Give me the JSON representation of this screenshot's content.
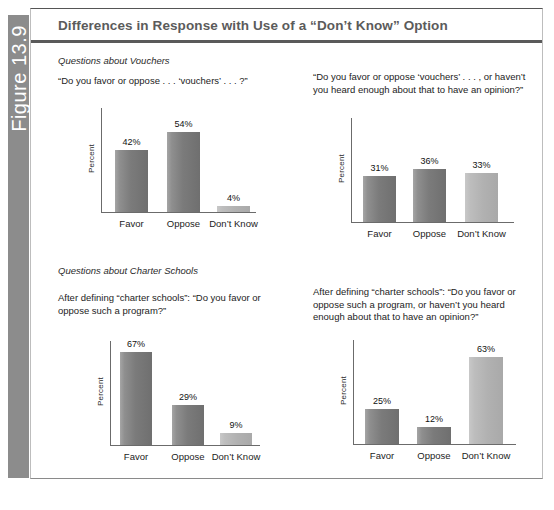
{
  "figure": {
    "number_label": "Figure 13.9",
    "title": "Differences in Response with Use of a “Don’t Know” Option"
  },
  "panels": [
    {
      "id": "vouchers-no-dk",
      "section_heading": "Questions about Vouchers",
      "question": "“Do you favor or oppose . . . ‘vouchers’ . . . ?”",
      "ylabel": "Percent"
    },
    {
      "id": "vouchers-with-dk",
      "section_heading": "",
      "question": "“Do you favor or oppose ‘vouchers’ . . . , or haven’t you heard enough about that to have an opinion?”",
      "ylabel": "Percent"
    },
    {
      "id": "charter-no-dk",
      "section_heading": "Questions about Charter Schools",
      "question": "After defining “charter schools”: “Do you favor or oppose such a program?”",
      "ylabel": "Percent"
    },
    {
      "id": "charter-with-dk",
      "section_heading": "",
      "question": "After defining “charter schools”: “Do you favor or oppose such a program, or haven’t you heard enough about that to have an opinion?”",
      "ylabel": "Percent"
    }
  ],
  "chart_data": [
    {
      "type": "bar",
      "id": "vouchers-no-dk",
      "title": "“Do you favor or oppose . . . ‘vouchers’ . . . ?”",
      "categories": [
        "Favor",
        "Oppose",
        "Don’t Know"
      ],
      "values": [
        42,
        54,
        4
      ],
      "value_labels": [
        "42%",
        "54%",
        "4%"
      ],
      "bar_styles": [
        "dark",
        "dark",
        "light"
      ],
      "xlabel": "",
      "ylabel": "Percent",
      "ylim": [
        0,
        70
      ],
      "grid": false,
      "legend": "none"
    },
    {
      "type": "bar",
      "id": "vouchers-with-dk",
      "title": "“Do you favor or oppose ‘vouchers’ . . . , or haven’t you heard enough about that to have an opinion?”",
      "categories": [
        "Favor",
        "Oppose",
        "Don’t Know"
      ],
      "values": [
        31,
        36,
        33
      ],
      "value_labels": [
        "31%",
        "36%",
        "33%"
      ],
      "bar_styles": [
        "dark",
        "dark",
        "light"
      ],
      "xlabel": "",
      "ylabel": "Percent",
      "ylim": [
        0,
        70
      ],
      "grid": false,
      "legend": "none"
    },
    {
      "type": "bar",
      "id": "charter-no-dk",
      "title": "After defining “charter schools”: “Do you favor or oppose such a program?”",
      "categories": [
        "Favor",
        "Oppose",
        "Don’t Know"
      ],
      "values": [
        67,
        29,
        9
      ],
      "value_labels": [
        "67%",
        "29%",
        "9%"
      ],
      "bar_styles": [
        "dark",
        "dark",
        "light"
      ],
      "xlabel": "",
      "ylabel": "Percent",
      "ylim": [
        0,
        75
      ],
      "grid": false,
      "legend": "none"
    },
    {
      "type": "bar",
      "id": "charter-with-dk",
      "title": "After defining “charter schools”: “Do you favor or oppose such a program, or haven’t you heard enough about that to have an opinion?”",
      "categories": [
        "Favor",
        "Oppose",
        "Don’t Know"
      ],
      "values": [
        25,
        12,
        63
      ],
      "value_labels": [
        "25%",
        "12%",
        "63%"
      ],
      "bar_styles": [
        "dark",
        "dark",
        "light"
      ],
      "xlabel": "",
      "ylabel": "Percent",
      "ylim": [
        0,
        75
      ],
      "grid": false,
      "legend": "none"
    }
  ],
  "colors": {
    "spine": "#8c8c8c",
    "title_text": "#5b5b5b",
    "bar_dark": "#7b7b7b",
    "bar_light": "#b1b1b1",
    "axis": "#6b6b6b"
  }
}
